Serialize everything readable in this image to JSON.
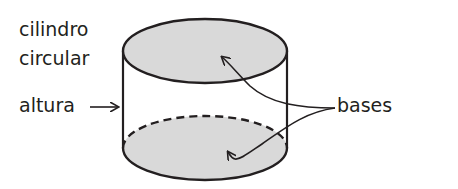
{
  "diagram": {
    "title_lines": [
      "cilindro",
      "circular"
    ],
    "labels": {
      "shape_line1": "cilindro",
      "shape_line2": "circular",
      "height": "altura",
      "bases": "bases"
    },
    "colors": {
      "stroke": "#231f20",
      "base_fill": "#d9d9d9",
      "background": "#ffffff"
    },
    "shape": "cylinder"
  }
}
